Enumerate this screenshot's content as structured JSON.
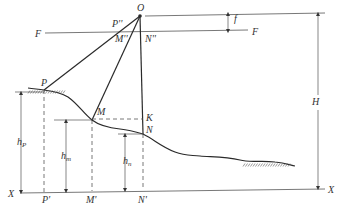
{
  "diagram": {
    "type": "aerial-photogrammetry-geometry",
    "colors": {
      "line": "#2a2a2a",
      "thin": "#555555",
      "dash": "#555555",
      "text": "#333333"
    },
    "points": {
      "O": {
        "x": 140,
        "y": 16
      },
      "P": {
        "x": 44,
        "y": 90
      },
      "M": {
        "x": 92,
        "y": 120
      },
      "N": {
        "x": 143,
        "y": 134
      },
      "K": {
        "x": 143,
        "y": 119
      },
      "P2": {
        "x": 116,
        "y": 33
      },
      "M2": {
        "x": 125,
        "y": 33
      },
      "N2": {
        "x": 141,
        "y": 33
      }
    },
    "labels": {
      "O": {
        "text": "O",
        "x": 137,
        "y": 11
      },
      "P2": {
        "text": "P''",
        "x": 112,
        "y": 27
      },
      "M2": {
        "text": "M''",
        "x": 115,
        "y": 42
      },
      "N2": {
        "text": "N''",
        "x": 145,
        "y": 42
      },
      "F_left": {
        "text": "F",
        "x": 35,
        "y": 37
      },
      "F_right": {
        "text": "F",
        "x": 252,
        "y": 35
      },
      "f": {
        "text": "f",
        "x": 234,
        "y": 22
      },
      "H": {
        "text": "H",
        "x": 312,
        "y": 105
      },
      "P": {
        "text": "P",
        "x": 41,
        "y": 86
      },
      "M": {
        "text": "M",
        "x": 97,
        "y": 115
      },
      "K": {
        "text": "K",
        "x": 146,
        "y": 121
      },
      "N": {
        "text": "N",
        "x": 146,
        "y": 133
      },
      "hp": {
        "text": "h",
        "sub": "P",
        "x": 17,
        "y": 145
      },
      "hm": {
        "text": "h",
        "sub": "m",
        "x": 61,
        "y": 159
      },
      "hn": {
        "text": "h",
        "sub": "n",
        "x": 123,
        "y": 164
      },
      "X_left": {
        "text": "X",
        "x": 8,
        "y": 197
      },
      "X_right": {
        "text": "X",
        "x": 328,
        "y": 193
      },
      "P1": {
        "text": "P'",
        "x": 42,
        "y": 203
      },
      "M1": {
        "text": "M'",
        "x": 86,
        "y": 203
      },
      "N1": {
        "text": "N'",
        "x": 138,
        "y": 203
      }
    },
    "lines": {
      "top_horizontal": {
        "x1": 145,
        "y1": 16,
        "x2": 325,
        "y2": 13
      },
      "focal_plane_F": {
        "x1": 45,
        "y1": 33,
        "x2": 248,
        "y2": 30
      },
      "datum_X": {
        "x1": 20,
        "y1": 193,
        "x2": 325,
        "y2": 189
      }
    },
    "terrain_path": "M28,88 C34,89 38,89 44,90 C52,91 60,92 68,97 C78,104 84,114 92,120 C100,126 110,128 120,129 C128,130 136,132 143,134 C155,140 160,146 175,152 C185,156 190,155 200,156 C210,157 225,156 240,160 C250,163 260,160 275,162 C285,163 290,165 295,166",
    "hatch_segments": [
      {
        "x1": 30,
        "x2": 66,
        "y": 90
      },
      {
        "x1": 245,
        "x2": 292,
        "y": 163
      }
    ]
  }
}
